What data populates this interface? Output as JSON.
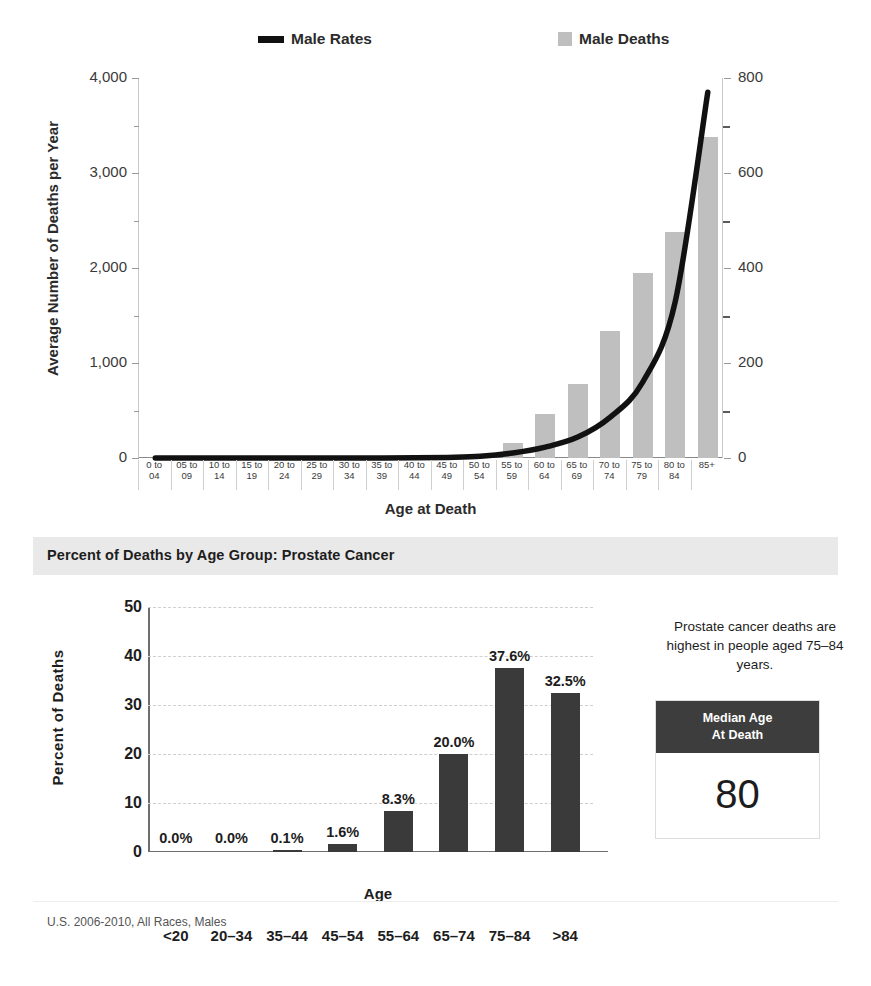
{
  "top_chart": {
    "legend": [
      {
        "name": "Male Rates",
        "type": "line",
        "color": "#111111"
      },
      {
        "name": "Male Deaths",
        "type": "bar",
        "color": "#bfbfbf"
      }
    ],
    "y_left_title": "Average Number of Deaths per Year",
    "y_right_title": "Rate per 100,000",
    "x_title": "Age at Death"
  },
  "bottom_panel": {
    "band_title": "Percent of Deaths by Age Group: Prostate Cancer",
    "y_title": "Percent of Deaths",
    "x_title": "Age",
    "note": "Prostate cancer deaths are highest in people aged 75–84 years.",
    "stat_card": {
      "title_line1": "Median Age",
      "title_line2": "At Death",
      "value": "80"
    },
    "footnote": "U.S. 2006-2010, All Races, Males"
  },
  "chart_data": [
    {
      "type": "bar",
      "title": "",
      "xlabel": "Age at Death",
      "ylabel": "Average Number of Deaths per Year",
      "y2label": "Rate per 100,000",
      "ylim": [
        0,
        4000
      ],
      "y2lim": [
        0,
        800
      ],
      "yticks": [
        0,
        1000,
        2000,
        3000,
        4000
      ],
      "ytick_labels": [
        "0",
        "1,000",
        "2,000",
        "3,000",
        "4,000"
      ],
      "y_minor_ticks": [
        500,
        1500,
        2500,
        3500
      ],
      "y2ticks": [
        0,
        200,
        400,
        600,
        800
      ],
      "y2tick_labels": [
        "0",
        "200",
        "400",
        "600",
        "800"
      ],
      "y2_minor_ticks": [
        100,
        300,
        500,
        700
      ],
      "grid": false,
      "legend_position": "top",
      "categories": [
        "0 to 04",
        "05 to 09",
        "10 to 14",
        "15 to 19",
        "20 to 24",
        "25 to 29",
        "30 to 34",
        "35 to 39",
        "40 to 44",
        "45 to 49",
        "50 to 54",
        "55 to 59",
        "60 to 64",
        "65 to 69",
        "70 to 74",
        "75 to 79",
        "80 to 84",
        "85+"
      ],
      "series": [
        {
          "name": "Male Deaths",
          "axis": "left",
          "type": "bar",
          "color": "#bfbfbf",
          "values": [
            0,
            0,
            0,
            0,
            0,
            0,
            0,
            1,
            4,
            14,
            42,
            155,
            460,
            775,
            1340,
            1950,
            2380,
            3380
          ]
        },
        {
          "name": "Male Rates",
          "axis": "right",
          "type": "line",
          "color": "#111111",
          "values": [
            0,
            0,
            0,
            0,
            0,
            0,
            0,
            0.1,
            0.4,
            1.3,
            3.7,
            10.5,
            23,
            44,
            86,
            160,
            330,
            770
          ]
        }
      ]
    },
    {
      "type": "bar",
      "title": "Percent of Deaths by Age Group: Prostate Cancer",
      "xlabel": "Age",
      "ylabel": "Percent of Deaths",
      "ylim": [
        0,
        50
      ],
      "yticks": [
        0,
        10,
        20,
        30,
        40,
        50
      ],
      "ytick_labels": [
        "0",
        "10",
        "20",
        "30",
        "40",
        "50"
      ],
      "grid": true,
      "grid_style": "dashed-horizontal",
      "legend_position": "none",
      "bar_color": "#3a3a3a",
      "categories": [
        "<20",
        "20–34",
        "35–44",
        "45–54",
        "55–64",
        "65–74",
        "75–84",
        ">84"
      ],
      "values": [
        0.0,
        0.0,
        0.1,
        1.6,
        8.3,
        20.0,
        37.6,
        32.5
      ],
      "value_labels": [
        "0.0%",
        "0.0%",
        "0.1%",
        "1.6%",
        "8.3%",
        "20.0%",
        "37.6%",
        "32.5%"
      ]
    }
  ]
}
